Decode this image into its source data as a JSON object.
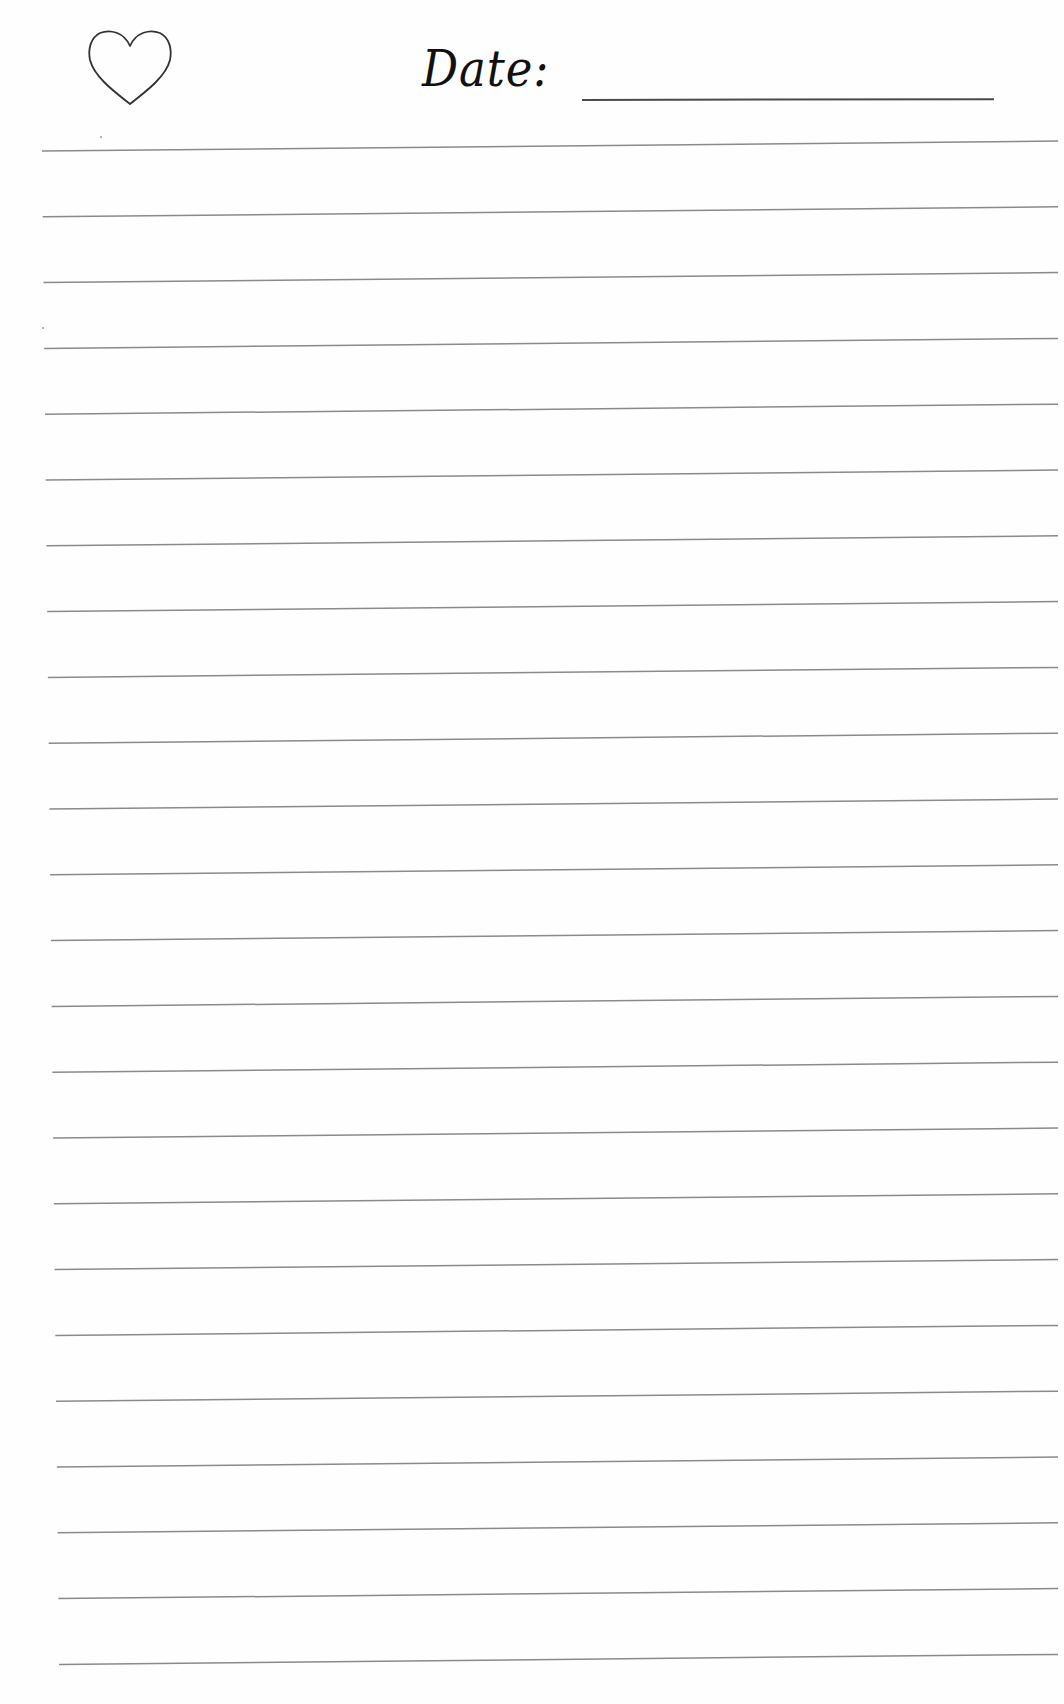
{
  "header": {
    "heart_icon": "heart-outline-icon",
    "date_label": "Date:",
    "date_value": ""
  },
  "ruled_lines": {
    "count": 24,
    "color": "#8a8a8a",
    "first_left_y": 151,
    "first_right_y": 141,
    "spacing": 65.8,
    "left_x_top": 42,
    "left_x_bottom": 59,
    "right_x": 1058
  },
  "colors": {
    "paper": "#fefefe",
    "ink": "#111111",
    "rule": "#8a8a8a"
  }
}
